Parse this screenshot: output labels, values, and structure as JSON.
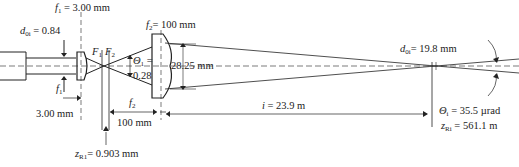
{
  "diagram": {
    "type": "optical beam expander",
    "labels": {
      "f1_top": {
        "sym": "f",
        "sub": "1",
        "value": " = 3.00 mm"
      },
      "d0_in": {
        "sym": "d",
        "sub": "0i",
        "value": " = 0.84"
      },
      "f2_top": {
        "sym": "f",
        "sub": "2",
        "value": "= 100 mm"
      },
      "F1": {
        "sym": "F",
        "sub": "1"
      },
      "F2": {
        "sym": "F",
        "sub": "2"
      },
      "theta1": {
        "sym": "Θ",
        "sub": "1",
        "value": " ="
      },
      "theta1_val": "0.28",
      "aperture": "28.25 mm",
      "f1_bottom": {
        "sym": "f",
        "sub": "1"
      },
      "f1_bottom_val": "3.00 mm",
      "f2_bottom": {
        "sym": "f",
        "sub": "2"
      },
      "f2_bottom_val": "100 mm",
      "zR1": {
        "sym": "z",
        "sub": "R1",
        "value": "= 0.903 mm"
      },
      "i_dist": {
        "sym": "i",
        "value": " = 23.9 m"
      },
      "d0_out": {
        "sym": "d",
        "sub": "0i",
        "value": "= 19.8 mm"
      },
      "theta_i": {
        "sym": "Θ",
        "sub": "i",
        "value": " = 35.5 µrad"
      },
      "zRi": {
        "sym": "z",
        "sub": "Ri",
        "value": " = 561.1 m"
      }
    }
  }
}
